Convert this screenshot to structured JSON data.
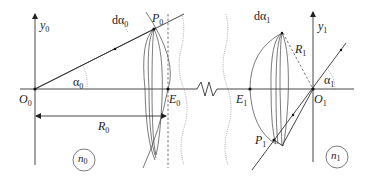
{
  "diagram": {
    "type": "optics-cavity-schematic",
    "left_side": {
      "origin_label": "O",
      "origin_sub": "0",
      "axis_label": "y",
      "axis_sub": "0",
      "point_label": "P",
      "point_sub": "0",
      "vertex_label": "E",
      "vertex_sub": "0",
      "angle_label": "α",
      "angle_sub": "0",
      "dangle_label": "dα",
      "dangle_sub": "0",
      "radius_label": "R",
      "radius_sub": "0",
      "medium_label": "n",
      "medium_sub": "0"
    },
    "right_side": {
      "origin_label": "O",
      "origin_sub": "1",
      "axis_label": "y",
      "axis_sub": "1",
      "point_label": "P",
      "point_sub": "1",
      "vertex_label": "E",
      "vertex_sub": "1",
      "angle_label": "α",
      "angle_sub": "1",
      "dangle_label": "dα",
      "dangle_sub": "1",
      "radius_label": "R",
      "radius_sub": "1",
      "medium_label": "n",
      "medium_sub": "1"
    }
  }
}
